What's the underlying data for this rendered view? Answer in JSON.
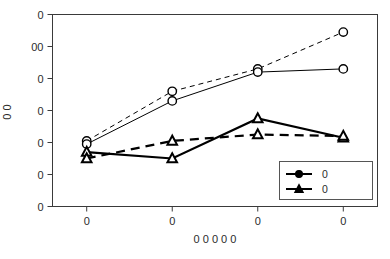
{
  "chart_data": {
    "type": "line",
    "title": "",
    "subtitle": "",
    "xlabel": "0 0 0 0 0",
    "ylabel": "0 0",
    "grid": false,
    "legend_position": "bottom-right",
    "x": [
      1,
      2,
      3,
      4
    ],
    "xtick_labels": [
      "0",
      "0",
      "0",
      "0"
    ],
    "ytick_labels": [
      "0",
      "00",
      "0",
      "0",
      "0",
      "0",
      "0"
    ],
    "ytick_values": [
      600,
      500,
      400,
      300,
      200,
      100,
      0
    ],
    "ylim": [
      0,
      600
    ],
    "xlim": [
      0.6,
      4.4
    ],
    "series": [
      {
        "name": "0",
        "marker": "circle",
        "linestyle": "dashed",
        "linewidth": 1,
        "values": [
          205,
          360,
          430,
          545
        ],
        "color": "#000000"
      },
      {
        "name": "0",
        "marker": "circle",
        "linestyle": "solid",
        "linewidth": 1,
        "values": [
          195,
          330,
          420,
          430
        ],
        "color": "#000000"
      },
      {
        "name": "0",
        "marker": "triangle",
        "linestyle": "solid",
        "linewidth": 2.2,
        "values": [
          170,
          150,
          275,
          215
        ],
        "color": "#000000"
      },
      {
        "name": "0",
        "marker": "triangle",
        "linestyle": "dashed",
        "linewidth": 2.2,
        "values": [
          150,
          205,
          225,
          220
        ],
        "color": "#000000"
      }
    ],
    "legend_entries": [
      {
        "label": "0",
        "marker": "circle",
        "linestyle": "solid"
      },
      {
        "label": "0",
        "marker": "triangle",
        "linestyle": "solid"
      }
    ],
    "axis_color": "#3a3a3a",
    "frame_color": "#3a3a3a"
  }
}
